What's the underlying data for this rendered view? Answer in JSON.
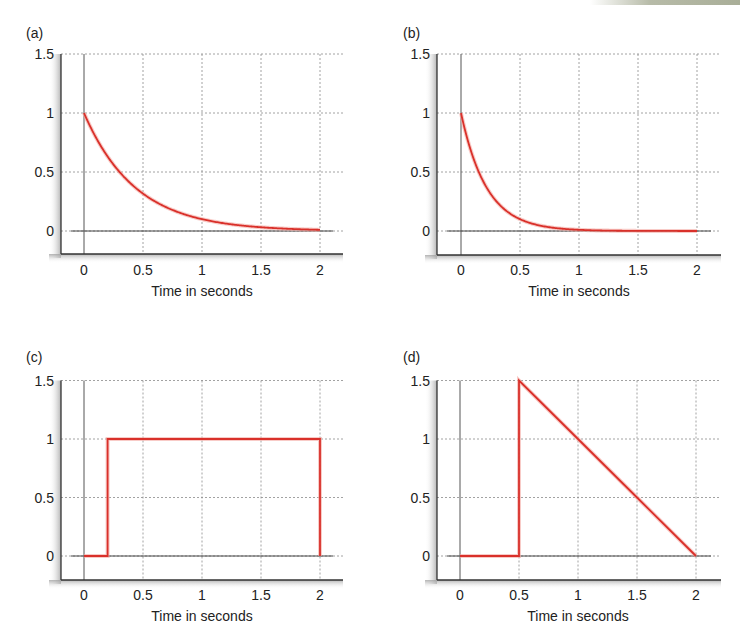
{
  "figure": {
    "panels": [
      {
        "id": "a",
        "label": "(a)",
        "xlabel": "Time in seconds",
        "xticks": [
          "0",
          "0.5",
          "1",
          "1.5",
          "2"
        ],
        "yticks": [
          "0",
          "0.5",
          "1",
          "1.5"
        ]
      },
      {
        "id": "b",
        "label": "(b)",
        "xlabel": "Time in seconds",
        "xticks": [
          "0",
          "0.5",
          "1",
          "1.5",
          "2"
        ],
        "yticks": [
          "0",
          "0.5",
          "1",
          "1.5"
        ]
      },
      {
        "id": "c",
        "label": "(c)",
        "xlabel": "Time in seconds",
        "xticks": [
          "0",
          "0.5",
          "1",
          "1.5",
          "2"
        ],
        "yticks": [
          "0",
          "0.5",
          "1",
          "1.5"
        ]
      },
      {
        "id": "d",
        "label": "(d)",
        "xlabel": "Time in seconds",
        "xticks": [
          "0",
          "0.5",
          "1",
          "1.5",
          "2"
        ],
        "yticks": [
          "0",
          "0.5",
          "1",
          "1.5"
        ]
      }
    ],
    "colors": {
      "curve": "#d9302a",
      "curve_glow": "#f4a9a2",
      "axis": "#333333",
      "grid": "#8a8a8a",
      "frame_shadow": "#9a9a9a"
    }
  },
  "chart_data": [
    {
      "panel": "(a)",
      "type": "line",
      "title": "",
      "xlabel": "Time in seconds",
      "ylabel": "",
      "xlim": [
        -0.2,
        2.2
      ],
      "ylim": [
        -0.2,
        1.5
      ],
      "xticks": [
        0,
        0.5,
        1,
        1.5,
        2
      ],
      "yticks": [
        0,
        0.5,
        1,
        1.5
      ],
      "grid": true,
      "description": "Decaying exponential, approx exp(-2.3t)",
      "x": [
        0,
        0.1,
        0.2,
        0.3,
        0.4,
        0.5,
        0.6,
        0.7,
        0.8,
        0.9,
        1.0,
        1.1,
        1.2,
        1.3,
        1.4,
        1.5,
        1.6,
        1.7,
        1.8,
        1.9,
        2.0
      ],
      "y": [
        1.0,
        0.79,
        0.63,
        0.5,
        0.4,
        0.32,
        0.25,
        0.2,
        0.16,
        0.13,
        0.1,
        0.08,
        0.06,
        0.05,
        0.04,
        0.03,
        0.025,
        0.02,
        0.016,
        0.013,
        0.01
      ]
    },
    {
      "panel": "(b)",
      "type": "line",
      "title": "",
      "xlabel": "Time in seconds",
      "ylabel": "",
      "xlim": [
        -0.2,
        2.2
      ],
      "ylim": [
        -0.2,
        1.5
      ],
      "xticks": [
        0,
        0.5,
        1,
        1.5,
        2
      ],
      "yticks": [
        0,
        0.5,
        1,
        1.5
      ],
      "grid": true,
      "description": "Faster decaying exponential, approx exp(-4.6t)",
      "x": [
        0,
        0.1,
        0.2,
        0.3,
        0.4,
        0.5,
        0.6,
        0.7,
        0.8,
        0.9,
        1.0,
        1.2,
        1.4,
        1.6,
        1.8,
        2.0
      ],
      "y": [
        1.0,
        0.63,
        0.4,
        0.25,
        0.16,
        0.1,
        0.063,
        0.04,
        0.025,
        0.016,
        0.01,
        0.004,
        0.002,
        0.001,
        0.0,
        0.0
      ]
    },
    {
      "panel": "(c)",
      "type": "line",
      "title": "",
      "xlabel": "Time in seconds",
      "ylabel": "",
      "xlim": [
        -0.2,
        2.2
      ],
      "ylim": [
        -0.2,
        1.5
      ],
      "xticks": [
        0,
        0.5,
        1,
        1.5,
        2
      ],
      "yticks": [
        0,
        0.5,
        1,
        1.5
      ],
      "grid": true,
      "description": "Rectangular pulse: 0 until t=0.2, 1 from t=0.2 to t=2, then back to 0",
      "x": [
        0,
        0.2,
        0.2,
        2.0,
        2.0
      ],
      "y": [
        0,
        0,
        1,
        1,
        0
      ]
    },
    {
      "panel": "(d)",
      "type": "line",
      "title": "",
      "xlabel": "Time in seconds",
      "ylabel": "",
      "xlim": [
        -0.2,
        2.2
      ],
      "ylim": [
        -0.2,
        1.5
      ],
      "xticks": [
        0,
        0.5,
        1,
        1.5,
        2
      ],
      "yticks": [
        0,
        0.5,
        1,
        1.5
      ],
      "grid": true,
      "description": "Sawtooth: 0 until t=0.5, jumps to 1.5, then ramps linearly down to 0 at t=2",
      "x": [
        0,
        0.5,
        0.5,
        1.0,
        1.5,
        2.0
      ],
      "y": [
        0,
        0,
        1.5,
        1.0,
        0.5,
        0
      ]
    }
  ]
}
